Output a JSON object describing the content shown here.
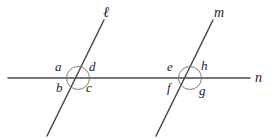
{
  "figure": {
    "width": 273,
    "height": 139,
    "background_color": "#ffffff",
    "stroke_color": "#4a4a4a",
    "text_color": "#242424"
  },
  "lines": [
    {
      "id": "line-n",
      "label": "n",
      "role": "horizontal-line",
      "x1": 8,
      "y1": 78,
      "x2": 250,
      "y2": 78,
      "label_x": 255,
      "label_y": 71
    },
    {
      "id": "line-l",
      "label": "ℓ",
      "role": "transversal-left",
      "x1": 47,
      "y1": 136,
      "x2": 104,
      "y2": 20,
      "label_x": 103,
      "label_y": 5
    },
    {
      "id": "line-m",
      "label": "m",
      "role": "transversal-right",
      "x1": 156,
      "y1": 136,
      "x2": 213,
      "y2": 20,
      "label_x": 214,
      "label_y": 6
    }
  ],
  "intersections": [
    {
      "id": "intersection-left",
      "cx": 78,
      "cy": 78,
      "r": 11.5,
      "lines": [
        "ℓ",
        "n"
      ]
    },
    {
      "id": "intersection-right",
      "cx": 190,
      "cy": 78,
      "r": 11.5,
      "lines": [
        "m",
        "n"
      ]
    }
  ],
  "angle_labels": [
    {
      "id": "angle-a",
      "text": "a",
      "x": 55,
      "y": 60,
      "position": "upper-left",
      "intersection": "intersection-left"
    },
    {
      "id": "angle-d",
      "text": "d",
      "x": 89,
      "y": 60,
      "position": "upper-right",
      "intersection": "intersection-left"
    },
    {
      "id": "angle-b",
      "text": "b",
      "x": 56,
      "y": 81,
      "position": "lower-left",
      "intersection": "intersection-left"
    },
    {
      "id": "angle-c",
      "text": "c",
      "x": 86,
      "y": 81,
      "position": "lower-right",
      "intersection": "intersection-left"
    },
    {
      "id": "angle-e",
      "text": "e",
      "x": 167,
      "y": 60,
      "position": "upper-left",
      "intersection": "intersection-right"
    },
    {
      "id": "angle-h",
      "text": "h",
      "x": 201,
      "y": 59,
      "position": "upper-right",
      "intersection": "intersection-right"
    },
    {
      "id": "angle-f",
      "text": "f",
      "x": 167,
      "y": 81,
      "position": "lower-left",
      "intersection": "intersection-right"
    },
    {
      "id": "angle-g",
      "text": "g",
      "x": 199,
      "y": 84,
      "position": "lower-right",
      "intersection": "intersection-right"
    }
  ]
}
